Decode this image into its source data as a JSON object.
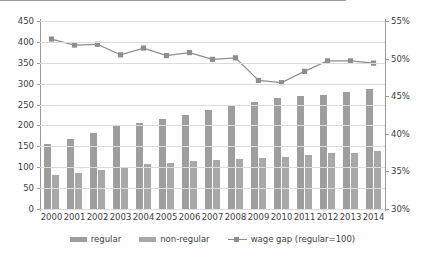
{
  "chart_data": {
    "type": "bar",
    "title": "",
    "xlabel": "",
    "ylabel": "",
    "categories": [
      "2000",
      "2001",
      "2002",
      "2003",
      "2004",
      "2005",
      "2006",
      "2007",
      "2008",
      "2009",
      "2010",
      "2011",
      "2012",
      "2013",
      "2014"
    ],
    "series": [
      {
        "name": "regular",
        "axis": "left",
        "type": "bar",
        "color": "#9e9e9e",
        "values": [
          155,
          168,
          181,
          199,
          207,
          216,
          224,
          238,
          247,
          256,
          265,
          271,
          274,
          279,
          288
        ]
      },
      {
        "name": "non-regular",
        "axis": "left",
        "type": "bar",
        "color": "#a8a8a8",
        "values": [
          82,
          87,
          94,
          101,
          108,
          110,
          114,
          117,
          120,
          121,
          124,
          129,
          133,
          135,
          138
        ]
      },
      {
        "name": "wage gap (regular=100)",
        "axis": "right",
        "type": "line",
        "color": "#8e8e8e",
        "values": [
          52.6,
          51.8,
          51.9,
          50.5,
          51.4,
          50.4,
          50.8,
          49.9,
          50.1,
          47.1,
          46.8,
          48.3,
          49.7,
          49.7,
          49.4
        ]
      }
    ],
    "ylim": [
      0,
      450
    ],
    "yticks": [
      "0",
      "50",
      "100",
      "150",
      "200",
      "250",
      "300",
      "350",
      "400",
      "450"
    ],
    "y2lim": [
      30,
      55
    ],
    "y2ticks": [
      "30%",
      "35%",
      "40%",
      "45%",
      "50%",
      "55%"
    ],
    "grid": true,
    "legend_position": "bottom",
    "legend": [
      "regular",
      "non-regular",
      "wage gap (regular=100)"
    ]
  }
}
